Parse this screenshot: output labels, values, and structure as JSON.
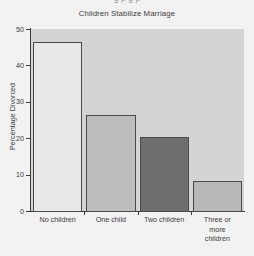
{
  "page": {
    "top_cropped_text": "g          p          g          p",
    "background_color": "#f2f2f2"
  },
  "chart_data": {
    "type": "bar",
    "title": "Children Stabilize Marriage",
    "xlabel": "",
    "ylabel": "Percentage Divorced",
    "categories": [
      "No children",
      "One child",
      "Two children",
      "Three or more children"
    ],
    "category_lines": [
      [
        "No children"
      ],
      [
        "One child"
      ],
      [
        "Two children"
      ],
      [
        "Three or",
        "more",
        "children"
      ]
    ],
    "values": [
      46.3,
      26.3,
      20.3,
      8.3
    ],
    "ylim": [
      0,
      50
    ],
    "yticks": [
      0,
      10,
      20,
      30,
      40,
      50
    ],
    "ytick_labels": [
      "0",
      "10",
      "20",
      "30",
      "40",
      "50"
    ],
    "grid": false,
    "legend": "none",
    "bar_colors": [
      "#e8e8e8",
      "#bdbdbd",
      "#6e6e6e",
      "#b8b8b8"
    ],
    "bar_edge_color": "#4a4a4a",
    "plot_background": "#d4d4d4",
    "axis_color": "#3a3a3a"
  }
}
